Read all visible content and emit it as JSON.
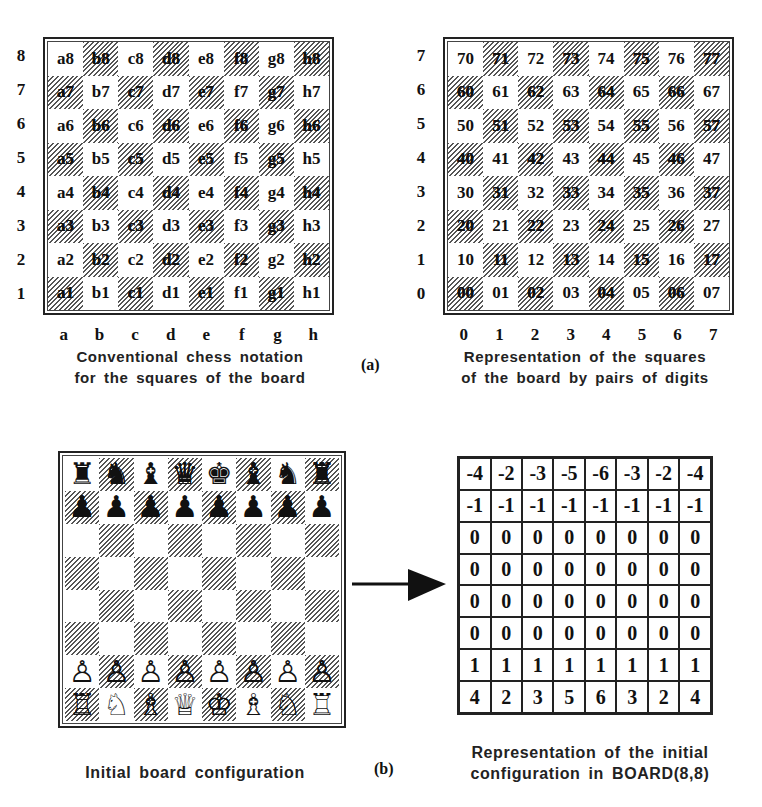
{
  "figure_label_a": "(a)",
  "figure_label_b": "(b)",
  "chess_notation": {
    "rank_labels": [
      "8",
      "7",
      "6",
      "5",
      "4",
      "3",
      "2",
      "1"
    ],
    "file_labels": [
      "a",
      "b",
      "c",
      "d",
      "e",
      "f",
      "g",
      "h"
    ],
    "rows": [
      [
        "a8",
        "b8",
        "c8",
        "d8",
        "e8",
        "f8",
        "g8",
        "h8"
      ],
      [
        "a7",
        "b7",
        "c7",
        "d7",
        "e7",
        "f7",
        "g7",
        "h7"
      ],
      [
        "a6",
        "b6",
        "c6",
        "d6",
        "e6",
        "f6",
        "g6",
        "h6"
      ],
      [
        "a5",
        "b5",
        "c5",
        "d5",
        "e5",
        "f5",
        "g5",
        "h5"
      ],
      [
        "a4",
        "b4",
        "c4",
        "d4",
        "e4",
        "f4",
        "g4",
        "h4"
      ],
      [
        "a3",
        "b3",
        "c3",
        "d3",
        "e3",
        "f3",
        "g3",
        "h3"
      ],
      [
        "a2",
        "b2",
        "c2",
        "d2",
        "e2",
        "f2",
        "g2",
        "h2"
      ],
      [
        "a1",
        "b1",
        "c1",
        "d1",
        "e1",
        "f1",
        "g1",
        "h1"
      ]
    ],
    "caption_line1": "Conventional chess notation",
    "caption_line2": "for the squares of the board"
  },
  "digit_pairs": {
    "rank_labels": [
      "7",
      "6",
      "5",
      "4",
      "3",
      "2",
      "1",
      "0"
    ],
    "file_labels": [
      "0",
      "1",
      "2",
      "3",
      "4",
      "5",
      "6",
      "7"
    ],
    "rows": [
      [
        "70",
        "71",
        "72",
        "73",
        "74",
        "75",
        "76",
        "77"
      ],
      [
        "60",
        "61",
        "62",
        "63",
        "64",
        "65",
        "66",
        "67"
      ],
      [
        "50",
        "51",
        "52",
        "53",
        "54",
        "55",
        "56",
        "57"
      ],
      [
        "40",
        "41",
        "42",
        "43",
        "44",
        "45",
        "46",
        "47"
      ],
      [
        "30",
        "31",
        "32",
        "33",
        "34",
        "35",
        "36",
        "37"
      ],
      [
        "20",
        "21",
        "22",
        "23",
        "24",
        "25",
        "26",
        "27"
      ],
      [
        "10",
        "11",
        "12",
        "13",
        "14",
        "15",
        "16",
        "17"
      ],
      [
        "00",
        "01",
        "02",
        "03",
        "04",
        "05",
        "06",
        "07"
      ]
    ],
    "caption_line1": "Representation of the squares",
    "caption_line2": "of the board by pairs of digits"
  },
  "initial_board": {
    "rows": [
      [
        "♜",
        "♞",
        "♝",
        "♛",
        "♚",
        "♝",
        "♞",
        "♜"
      ],
      [
        "♟",
        "♟",
        "♟",
        "♟",
        "♟",
        "♟",
        "♟",
        "♟"
      ],
      [
        "",
        "",
        "",
        "",
        "",
        "",
        "",
        ""
      ],
      [
        "",
        "",
        "",
        "",
        "",
        "",
        "",
        ""
      ],
      [
        "",
        "",
        "",
        "",
        "",
        "",
        "",
        ""
      ],
      [
        "",
        "",
        "",
        "",
        "",
        "",
        "",
        ""
      ],
      [
        "♙",
        "♙",
        "♙",
        "♙",
        "♙",
        "♙",
        "♙",
        "♙"
      ],
      [
        "♖",
        "♘",
        "♗",
        "♕",
        "♔",
        "♗",
        "♘",
        "♖"
      ]
    ],
    "piece_names": [
      [
        "black-rook",
        "black-knight",
        "black-bishop",
        "black-queen",
        "black-king",
        "black-bishop",
        "black-knight",
        "black-rook"
      ],
      [
        "black-pawn",
        "black-pawn",
        "black-pawn",
        "black-pawn",
        "black-pawn",
        "black-pawn",
        "black-pawn",
        "black-pawn"
      ],
      [],
      [],
      [],
      [],
      [
        "white-pawn",
        "white-pawn",
        "white-pawn",
        "white-pawn",
        "white-pawn",
        "white-pawn",
        "white-pawn",
        "white-pawn"
      ],
      [
        "white-rook",
        "white-knight",
        "white-bishop",
        "white-queen",
        "white-king",
        "white-bishop",
        "white-knight",
        "white-rook"
      ]
    ],
    "caption": "Initial board configuration"
  },
  "board_array": {
    "rows": [
      [
        "-4",
        "-2",
        "-3",
        "-5",
        "-6",
        "-3",
        "-2",
        "-4"
      ],
      [
        "-1",
        "-1",
        "-1",
        "-1",
        "-1",
        "-1",
        "-1",
        "-1"
      ],
      [
        "0",
        "0",
        "0",
        "0",
        "0",
        "0",
        "0",
        "0"
      ],
      [
        "0",
        "0",
        "0",
        "0",
        "0",
        "0",
        "0",
        "0"
      ],
      [
        "0",
        "0",
        "0",
        "0",
        "0",
        "0",
        "0",
        "0"
      ],
      [
        "0",
        "0",
        "0",
        "0",
        "0",
        "0",
        "0",
        "0"
      ],
      [
        "1",
        "1",
        "1",
        "1",
        "1",
        "1",
        "1",
        "1"
      ],
      [
        "4",
        "2",
        "3",
        "5",
        "6",
        "3",
        "2",
        "4"
      ]
    ],
    "caption_line1": "Representation of the initial",
    "caption_line2": "configuration in BOARD(8,8)"
  },
  "arrow": {
    "direction": "right",
    "meaning": "maps-to"
  }
}
